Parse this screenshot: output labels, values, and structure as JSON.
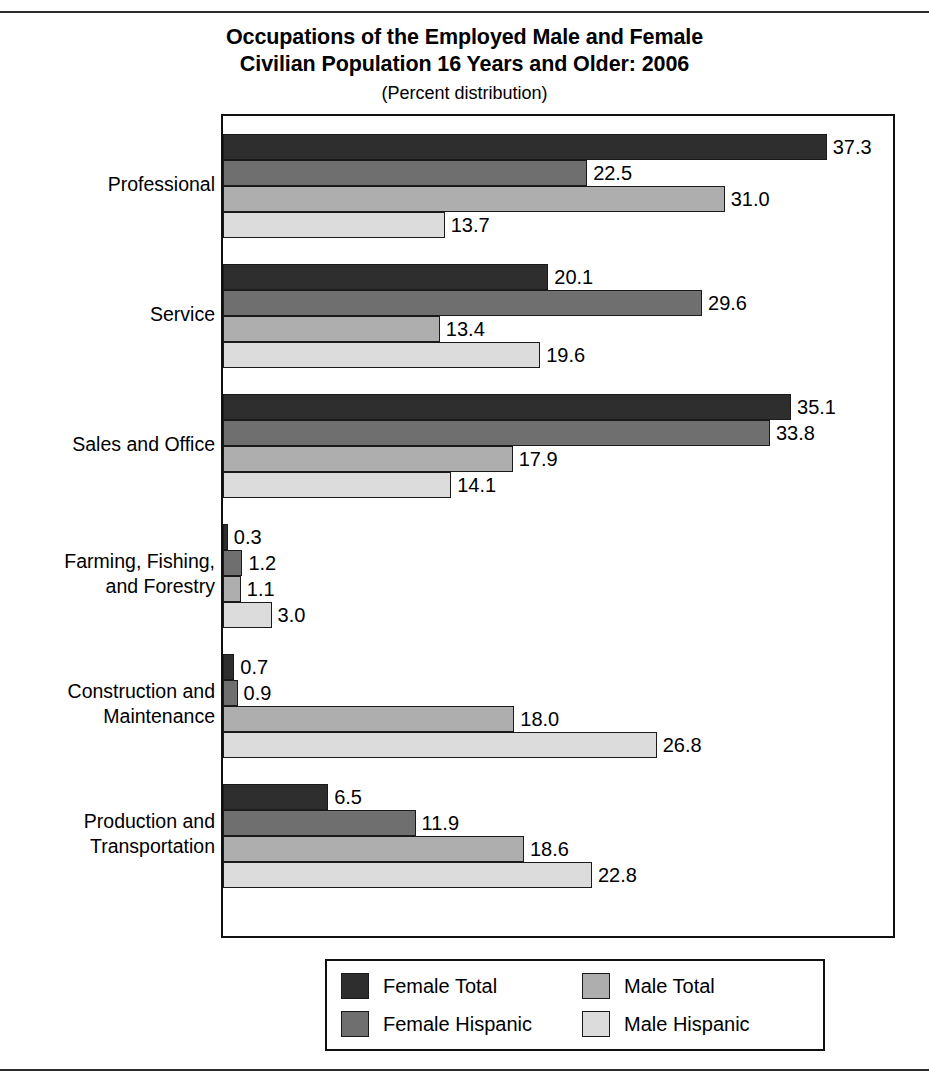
{
  "chart_data": {
    "type": "bar",
    "orientation": "horizontal",
    "title": "Occupations of the Employed Male and Female Civilian Population 16 Years and Older: 2006",
    "title_line1": "Occupations of the Employed Male and Female",
    "title_line2": "Civilian Population 16 Years and Older: 2006",
    "subtitle": "(Percent distribution)",
    "xlabel": "",
    "ylabel": "",
    "xlim": [
      0,
      41.4
    ],
    "grid": false,
    "legend_position": "bottom",
    "categories": [
      "Professional",
      "Service",
      "Sales and Office",
      "Farming, Fishing, and Forestry",
      "Construction and Maintenance",
      "Production and Transportation"
    ],
    "category_lines": [
      [
        "Professional"
      ],
      [
        "Service"
      ],
      [
        "Sales and Office"
      ],
      [
        "Farming, Fishing,",
        "and Forestry"
      ],
      [
        "Construction and",
        "Maintenance"
      ],
      [
        "Production and",
        "Transportation"
      ]
    ],
    "series": [
      {
        "name": "Female Total",
        "color": "#2e2e2e",
        "values": [
          37.3,
          20.1,
          35.1,
          0.3,
          0.7,
          6.5
        ],
        "labels": [
          "37.3",
          "20.1",
          "35.1",
          "0.3",
          "0.7",
          "6.5"
        ]
      },
      {
        "name": "Female Hispanic",
        "color": "#6f6f6f",
        "values": [
          22.5,
          29.6,
          33.8,
          1.2,
          0.9,
          11.9
        ],
        "labels": [
          "22.5",
          "29.6",
          "33.8",
          "1.2",
          "0.9",
          "11.9"
        ]
      },
      {
        "name": "Male Total",
        "color": "#aeaeae",
        "values": [
          31.0,
          13.4,
          17.9,
          1.1,
          18.0,
          18.6
        ],
        "labels": [
          "31.0",
          "13.4",
          "17.9",
          "1.1",
          "18.0",
          "18.6"
        ]
      },
      {
        "name": "Male Hispanic",
        "color": "#dcdcdc",
        "values": [
          13.7,
          19.6,
          14.1,
          3.0,
          26.8,
          22.8
        ],
        "labels": [
          "13.7",
          "19.6",
          "14.1",
          "3.0",
          "26.8",
          "22.8"
        ]
      }
    ],
    "legend_entries": [
      {
        "label": "Female Total",
        "color": "#2e2e2e"
      },
      {
        "label": "Male Total",
        "color": "#aeaeae"
      },
      {
        "label": "Female Hispanic",
        "color": "#6f6f6f"
      },
      {
        "label": "Male Hispanic",
        "color": "#dcdcdc"
      }
    ]
  }
}
